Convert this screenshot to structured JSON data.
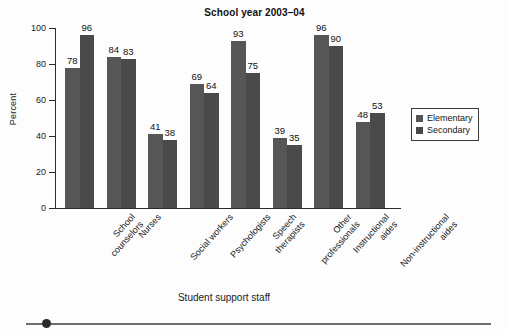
{
  "chart_data": {
    "type": "bar",
    "title": "School year 2003–04",
    "xlabel": "Student support staff",
    "ylabel": "Percent",
    "ylim": [
      0,
      100
    ],
    "yticks": [
      0,
      20,
      40,
      60,
      80,
      100
    ],
    "grid": false,
    "legend_position": "right",
    "categories": [
      "School counselors",
      "Nurses",
      "Social workers",
      "Psychologists",
      "Speech therapists",
      "Other professionals",
      "Instructional aides",
      "Non-instructional aides"
    ],
    "series": [
      {
        "name": "Elementary",
        "color": "#565656",
        "values": [
          78,
          84,
          41,
          69,
          93,
          39,
          96,
          48
        ]
      },
      {
        "name": "Secondary",
        "color": "#4a4a4a",
        "values": [
          96,
          83,
          38,
          64,
          75,
          35,
          90,
          53
        ]
      }
    ]
  },
  "category_label_lines": [
    [
      "School",
      "counselors"
    ],
    [
      "Nurses"
    ],
    [
      "Social workers"
    ],
    [
      "Psychologists"
    ],
    [
      "Speech",
      "therapists"
    ],
    [
      "Other",
      "professionals"
    ],
    [
      "Instructional",
      "aides"
    ],
    [
      "Non-instructional",
      "aides"
    ]
  ],
  "slider": {
    "name": "horizontal-scroll-slider",
    "value": 3
  }
}
